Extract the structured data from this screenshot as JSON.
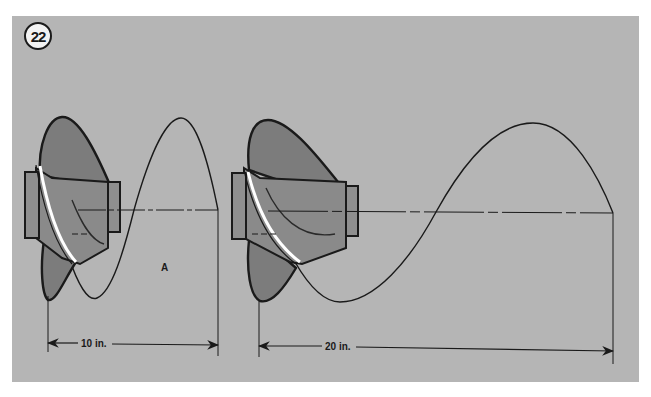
{
  "figure": {
    "number": "22",
    "background_color": "#b5b5b5",
    "line_color": "#1a1a1a",
    "blade_color": "#7c7c7c",
    "hub_color": "#8a8a8a"
  },
  "diagrams": [
    {
      "id": "propeller-10in-pitch",
      "region_label": "A",
      "dimension_label": "10 in."
    },
    {
      "id": "propeller-20in-pitch",
      "dimension_label": "20 in."
    }
  ]
}
